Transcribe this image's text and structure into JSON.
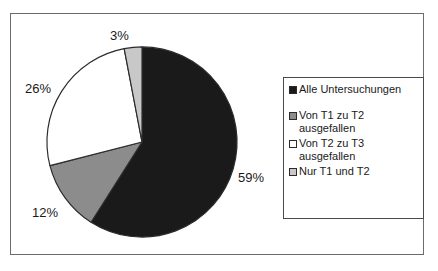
{
  "chart_data": {
    "type": "pie",
    "title": "",
    "subtitle": "",
    "xlabel": "",
    "ylabel": "",
    "legend_position": "right",
    "grid": false,
    "start_angle_deg": 0,
    "direction": "clockwise",
    "categories": [
      "Alle Untersuchungen",
      "Von T1 zu T2 ausgefallen",
      "Von T2 zu T3 ausgefallen",
      "Nur T1 und T2"
    ],
    "values": [
      59,
      12,
      26,
      3
    ],
    "value_unit": "%",
    "data_labels": [
      "59%",
      "12%",
      "26%",
      "3%"
    ],
    "colors": [
      "#1a1a1a",
      "#8c8c8c",
      "#ffffff",
      "#c8c8c8"
    ],
    "slices": [
      {
        "label": "Alle Untersuchungen",
        "value": 59,
        "data_label": "59%",
        "color": "#1a1a1a"
      },
      {
        "label": "Von T1 zu T2 ausgefallen",
        "value": 12,
        "data_label": "12%",
        "color": "#8c8c8c"
      },
      {
        "label": "Von T2 zu T3 ausgefallen",
        "value": 26,
        "data_label": "26%",
        "color": "#ffffff"
      },
      {
        "label": "Nur T1 und T2",
        "value": 3,
        "data_label": "3%",
        "color": "#c8c8c8"
      }
    ]
  },
  "labels": {
    "top": "3%",
    "left": "26%",
    "bottom": "12%",
    "right": "59%"
  },
  "legend": {
    "entries": [
      {
        "label": "Alle Untersuchungen",
        "color": "#1a1a1a"
      },
      {
        "label": "Von T1 zu T2\nausgefallen",
        "color": "#8c8c8c"
      },
      {
        "label": "Von T2 zu T3\nausgefallen",
        "color": "#ffffff"
      },
      {
        "label": "Nur T1 und T2",
        "color": "#c8c8c8"
      }
    ]
  },
  "style": {
    "frame_color": "#6b6b6b",
    "legend_border_color": "#4a4a4a",
    "slice_outline_color": "#2b2b2b",
    "background": "#ffffff",
    "text_color": "#1a1a1a"
  }
}
